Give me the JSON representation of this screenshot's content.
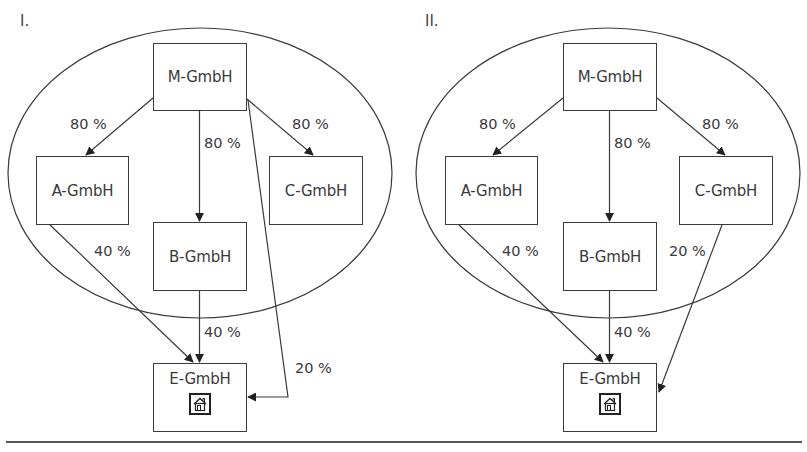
{
  "diagrams": [
    {
      "label": "I.",
      "companies": {
        "m": "M-GmbH",
        "a": "A-GmbH",
        "b": "B-GmbH",
        "c": "C-GmbH",
        "e": "E-GmbH"
      },
      "edges": {
        "m_a": "80 %",
        "m_b": "80 %",
        "m_c": "80 %",
        "a_e": "40 %",
        "b_e": "40 %",
        "m_e": "20 %"
      },
      "e_icon": "house-icon"
    },
    {
      "label": "II.",
      "companies": {
        "m": "M-GmbH",
        "a": "A-GmbH",
        "b": "B-GmbH",
        "c": "C-GmbH",
        "e": "E-GmbH"
      },
      "edges": {
        "m_a": "80 %",
        "m_b": "80 %",
        "m_c": "80 %",
        "a_e": "40 %",
        "b_e": "40 %",
        "c_e": "20 %"
      },
      "e_icon": "house-icon"
    }
  ],
  "colors": {
    "line": "#3a3a3a",
    "text": "#3a3a3a",
    "background": "#ffffff"
  }
}
